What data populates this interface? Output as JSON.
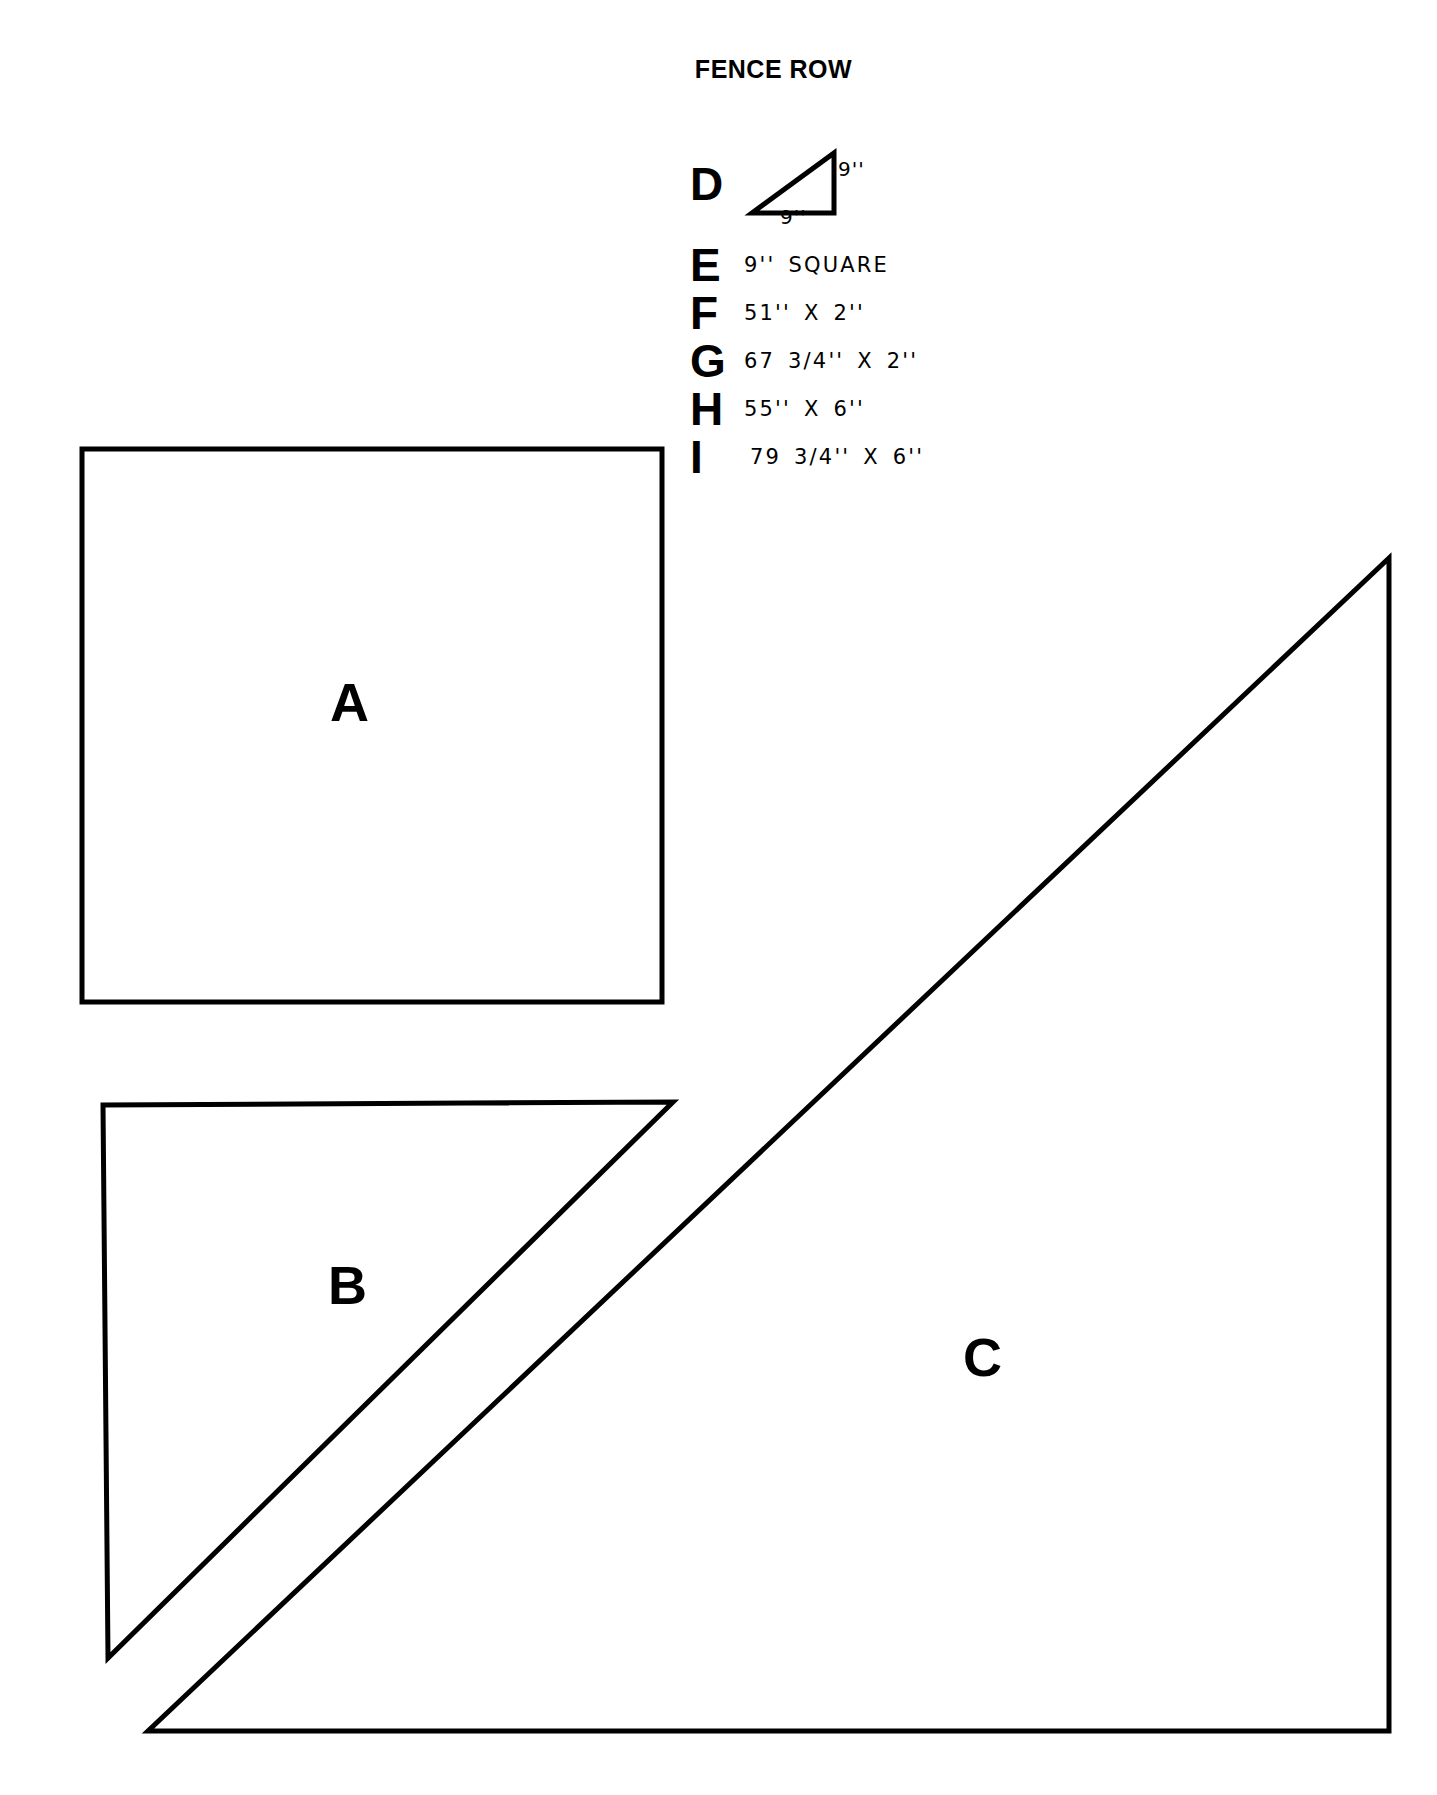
{
  "title": "FENCE ROW",
  "shapes": [
    {
      "letter": "A",
      "name": "square-a"
    },
    {
      "letter": "B",
      "name": "triangle-b"
    },
    {
      "letter": "C",
      "name": "triangle-c"
    }
  ],
  "legend": {
    "d": {
      "letter": "D",
      "dim_vertical": "9''",
      "dim_horizontal": "9''"
    },
    "rows": [
      {
        "letter": "E",
        "text": "9'' SQUARE"
      },
      {
        "letter": "F",
        "text": "51'' X 2''"
      },
      {
        "letter": "G",
        "text": "67 3/4'' X 2''"
      },
      {
        "letter": "H",
        "text": "55'' X 6''"
      },
      {
        "letter": "I",
        "text": "79 3/4'' X 6''"
      }
    ]
  },
  "style": {
    "ink": "#000000",
    "paper": "#ffffff"
  }
}
